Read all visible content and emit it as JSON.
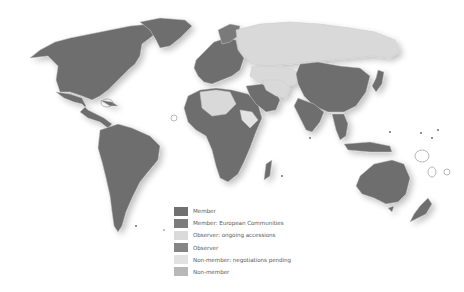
{
  "map": {
    "subject": "World map of membership status",
    "colors": {
      "member": "#6e6e6e",
      "member_ec": "#787878",
      "observer_accessions": "#d9d9d9",
      "observer": "#8a8a8a",
      "non_member_pending": "#e3e3e3",
      "non_member": "#b4b4b4",
      "background": "#ffffff",
      "border": "#c8c8c8"
    }
  },
  "legend": {
    "items": [
      {
        "label": "Member",
        "color": "#707070"
      },
      {
        "label": "Member: European Communities",
        "color": "#7c7c7c"
      },
      {
        "label": "Observer: ongoing accessions",
        "color": "#dadada"
      },
      {
        "label": "Observer",
        "color": "#858585"
      },
      {
        "label": "Non-member: negotiations pending",
        "color": "#e2e2e2"
      },
      {
        "label": "Non-member",
        "color": "#b8b8b8"
      }
    ]
  }
}
